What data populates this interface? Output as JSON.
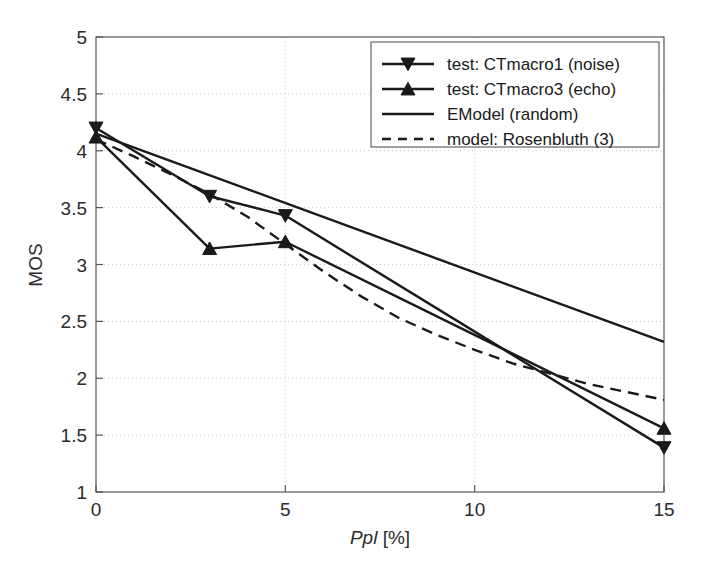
{
  "chart_data": {
    "type": "line",
    "title": "",
    "xlabel": "Ppl [%]",
    "xlabel_italic_part": "Ppl",
    "xlabel_plain_part": " [%]",
    "ylabel": "MOS",
    "xlim": [
      0,
      15
    ],
    "ylim": [
      1,
      5
    ],
    "xticks": [
      0,
      5,
      10,
      15
    ],
    "xtick_labels": [
      "0",
      "5",
      "10",
      "15"
    ],
    "yticks": [
      1,
      1.5,
      2,
      2.5,
      3,
      3.5,
      4,
      4.5,
      5
    ],
    "ytick_labels": [
      "1",
      "1.5",
      "2",
      "2.5",
      "3",
      "3.5",
      "4",
      "4.5",
      "5"
    ],
    "grid": true,
    "grid_style": "dotted",
    "legend_position": "top-right",
    "series": [
      {
        "name": "test: CTmacro1 (noise)",
        "marker": "triangle-down",
        "line_style": "solid",
        "color": "#1a1a1a",
        "x": [
          0,
          3,
          5,
          15
        ],
        "values": [
          4.2,
          3.6,
          3.43,
          1.39
        ]
      },
      {
        "name": "test: CTmacro3 (echo)",
        "marker": "triangle-up",
        "line_style": "solid",
        "color": "#1a1a1a",
        "x": [
          0,
          3,
          5,
          15
        ],
        "values": [
          4.12,
          3.14,
          3.2,
          1.56
        ]
      },
      {
        "name": "EModel (random)",
        "marker": "none",
        "line_style": "solid",
        "color": "#1a1a1a",
        "x": [
          0,
          15
        ],
        "values": [
          4.15,
          2.32
        ]
      },
      {
        "name": "model: Rosenbluth (3)",
        "marker": "none",
        "line_style": "dashed",
        "color": "#1a1a1a",
        "x": [
          0,
          1,
          2,
          3,
          4,
          5,
          6,
          7,
          8,
          9,
          10,
          11,
          12,
          13,
          14,
          15
        ],
        "values": [
          4.1,
          3.95,
          3.79,
          3.62,
          3.42,
          3.18,
          2.94,
          2.72,
          2.53,
          2.38,
          2.25,
          2.13,
          2.04,
          1.95,
          1.88,
          1.81
        ]
      }
    ]
  },
  "legend": {
    "entries": [
      {
        "label": "test: CTmacro1 (noise)",
        "marker": "triangle-down",
        "dash": false
      },
      {
        "label": "test: CTmacro3 (echo)",
        "marker": "triangle-up",
        "dash": false
      },
      {
        "label": "EModel (random)",
        "marker": "none",
        "dash": false
      },
      {
        "label": "model: Rosenbluth (3)",
        "marker": "none",
        "dash": true
      }
    ]
  },
  "colors": {
    "line": "#1a1a1a",
    "axis": "#555555",
    "grid": "#cccccc",
    "background": "#ffffff"
  }
}
